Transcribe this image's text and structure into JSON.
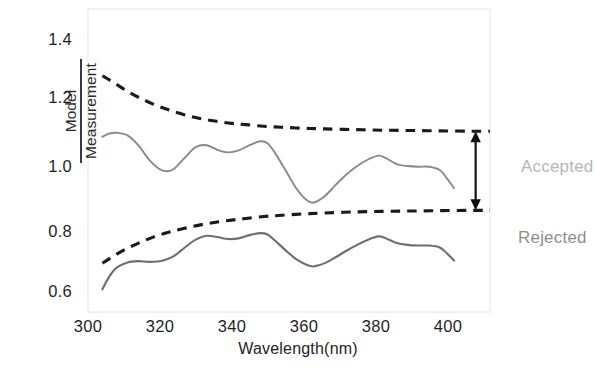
{
  "chart_data": {
    "type": "line",
    "title": "",
    "xlabel": "Wavelength(nm)",
    "ylabel_numerator": "Model",
    "ylabel_denominator": "Measurement",
    "xlim": [
      296,
      408
    ],
    "ylim": [
      0.55,
      1.48
    ],
    "xticks": [
      300,
      320,
      340,
      360,
      380,
      400
    ],
    "xtick_labels": [
      "300",
      "320",
      "340",
      "360",
      "380",
      "400"
    ],
    "yticks": [
      0.6,
      0.8,
      1.0,
      1.2,
      1.4
    ],
    "ytick_labels": [
      "0.6",
      "0.8",
      "1.0",
      "1.2",
      "1.4"
    ],
    "grid": false,
    "legend": "none",
    "frame": "box",
    "series": [
      {
        "name": "upper-acceptance-limit",
        "style": "dashed",
        "color": "#1a1a1a",
        "x": [
          300,
          302,
          305,
          308,
          311,
          314,
          317,
          320,
          324,
          328,
          332,
          336,
          340,
          345,
          350,
          356,
          362,
          370,
          378,
          386,
          394,
          402,
          408
        ],
        "values": [
          1.275,
          1.262,
          1.241,
          1.221,
          1.204,
          1.189,
          1.176,
          1.165,
          1.152,
          1.142,
          1.135,
          1.129,
          1.125,
          1.12,
          1.117,
          1.114,
          1.112,
          1.11,
          1.108,
          1.107,
          1.106,
          1.105,
          1.105
        ]
      },
      {
        "name": "lower-acceptance-limit",
        "style": "dashed",
        "color": "#1a1a1a",
        "x": [
          300,
          302,
          305,
          308,
          311,
          314,
          317,
          320,
          324,
          328,
          332,
          336,
          340,
          345,
          350,
          356,
          362,
          370,
          378,
          386,
          394,
          402,
          408
        ],
        "values": [
          0.7,
          0.714,
          0.734,
          0.751,
          0.766,
          0.779,
          0.79,
          0.799,
          0.81,
          0.819,
          0.826,
          0.832,
          0.837,
          0.843,
          0.847,
          0.851,
          0.854,
          0.857,
          0.859,
          0.86,
          0.861,
          0.862,
          0.862
        ]
      },
      {
        "name": "accepted-ratio-curve",
        "style": "solid",
        "color": "#8a8a8a",
        "x": [
          300,
          302,
          304,
          307,
          310,
          313,
          316,
          318,
          320,
          323,
          326,
          329,
          332,
          335,
          338,
          341,
          344,
          346,
          348,
          351,
          354,
          357,
          359,
          362,
          365,
          368,
          371,
          374,
          377,
          379,
          382,
          385,
          388,
          391,
          394,
          396,
          398
        ],
        "values": [
          1.088,
          1.098,
          1.1,
          1.092,
          1.062,
          1.018,
          0.988,
          0.982,
          0.99,
          1.024,
          1.056,
          1.062,
          1.048,
          1.04,
          1.046,
          1.062,
          1.074,
          1.068,
          1.04,
          0.986,
          0.93,
          0.893,
          0.886,
          0.906,
          0.94,
          0.972,
          0.998,
          1.018,
          1.03,
          1.022,
          1.004,
          0.998,
          0.996,
          0.996,
          0.986,
          0.96,
          0.93
        ]
      },
      {
        "name": "rejected-ratio-curve",
        "style": "solid",
        "color": "#6e6e6e",
        "x": [
          300,
          302,
          304,
          307,
          310,
          313,
          316,
          318,
          320,
          323,
          326,
          329,
          332,
          335,
          338,
          341,
          344,
          346,
          348,
          351,
          354,
          357,
          359,
          362,
          365,
          368,
          371,
          374,
          377,
          379,
          382,
          385,
          388,
          391,
          394,
          396,
          398
        ],
        "values": [
          0.62,
          0.66,
          0.686,
          0.702,
          0.706,
          0.704,
          0.706,
          0.712,
          0.722,
          0.748,
          0.772,
          0.784,
          0.78,
          0.774,
          0.776,
          0.786,
          0.792,
          0.788,
          0.77,
          0.74,
          0.712,
          0.694,
          0.69,
          0.7,
          0.718,
          0.738,
          0.756,
          0.772,
          0.782,
          0.776,
          0.762,
          0.756,
          0.754,
          0.754,
          0.748,
          0.73,
          0.708
        ]
      }
    ],
    "annotations": [
      {
        "name": "accepted-label",
        "text": "Accepted",
        "x": 408,
        "y": 1.03,
        "color": "#b6b6b6"
      },
      {
        "name": "rejected-label",
        "text": "Rejected",
        "x": 408,
        "y": 0.79,
        "color": "#8e8e8e"
      },
      {
        "name": "acceptance-band-arrow",
        "text": "",
        "x": 404,
        "y_from": 0.862,
        "y_to": 1.105,
        "color": "#111111"
      }
    ]
  }
}
